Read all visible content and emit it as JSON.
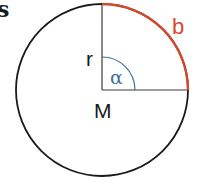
{
  "figure": {
    "corner_text": "s",
    "labels": {
      "radius": "r",
      "angle": "α",
      "center": "M",
      "arc": "b"
    },
    "colors": {
      "circle": "#1a1a1a",
      "radii": "#3a3a3a",
      "arc_b": "#d24a2e",
      "angle_arc": "#3f6fa0",
      "background": "#ffffff"
    },
    "geometry": {
      "center": [
        102,
        90
      ],
      "radius": 86,
      "angle_arc_radius": 33,
      "sector_angle_deg": 90
    }
  }
}
